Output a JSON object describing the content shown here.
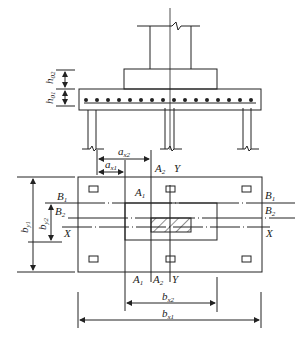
{
  "diagram": {
    "type": "pile-cap-foundation",
    "elevation_labels": {
      "h02": {
        "main": "h",
        "sub": "02"
      },
      "h01": {
        "main": "h",
        "sub": "01"
      }
    },
    "plan_labels": {
      "ax2": {
        "main": "a",
        "sub": "x2"
      },
      "ax1": {
        "main": "a",
        "sub": "x1"
      },
      "A1_top": {
        "main": "A",
        "sub": "1"
      },
      "A2_top": {
        "main": "A",
        "sub": "2"
      },
      "Y_top": "Y",
      "B1_left": {
        "main": "B",
        "sub": "1"
      },
      "B2_left": {
        "main": "B",
        "sub": "2"
      },
      "X_left": "X",
      "B1_right": {
        "main": "B",
        "sub": "1"
      },
      "B2_right": {
        "main": "B",
        "sub": "2"
      },
      "X_right": "X",
      "by1": {
        "main": "b",
        "sub": "y1"
      },
      "by2": {
        "main": "b",
        "sub": "y2"
      },
      "A1_bottom": {
        "main": "A",
        "sub": "1"
      },
      "A2_bottom": {
        "main": "A",
        "sub": "2"
      },
      "Y_bottom": "Y",
      "bx2": {
        "main": "b",
        "sub": "x2"
      },
      "bx1": {
        "main": "b",
        "sub": "x1"
      }
    },
    "colors": {
      "line": "#222222",
      "background": "#ffffff"
    }
  }
}
